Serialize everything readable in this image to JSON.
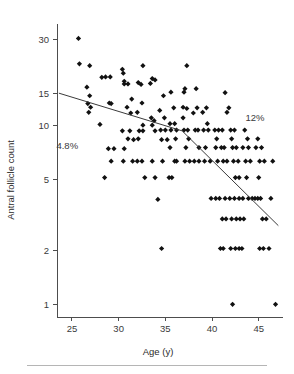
{
  "chart_data": {
    "type": "scatter",
    "title": "",
    "xlabel": "Age (y)",
    "ylabel": "Antral follicle count",
    "xlim": [
      23.4,
      47.6
    ],
    "ylim": [
      0.85,
      34
    ],
    "yscale": "log",
    "grid": false,
    "legend_position": "none",
    "xticks": [
      25,
      30,
      35,
      40,
      45
    ],
    "yticks": [
      1,
      2,
      5,
      10,
      15,
      30
    ],
    "xtick_labels": [
      "25",
      "30",
      "35",
      "40",
      "45"
    ],
    "ytick_labels": [
      "1",
      "2",
      "5",
      "10",
      "15",
      "30"
    ],
    "annotations": [
      {
        "name": "rate-left",
        "text": "4.8%",
        "x": 24.5,
        "y": 7.4
      },
      {
        "name": "rate-right",
        "text": "12%",
        "x": 44.6,
        "y": 10.6
      }
    ],
    "trend_line": {
      "name": "segmented-regression",
      "breakpoint_age": 36.8,
      "points": [
        {
          "x": 23.6,
          "y": 15.1
        },
        {
          "x": 36.8,
          "y": 9.3
        },
        {
          "x": 47.1,
          "y": 2.75
        }
      ]
    },
    "points": [
      {
        "x": 25.7,
        "y": 30.5
      },
      {
        "x": 25.8,
        "y": 22.0
      },
      {
        "x": 26.9,
        "y": 21.5
      },
      {
        "x": 26.6,
        "y": 16.3
      },
      {
        "x": 26.9,
        "y": 14.6
      },
      {
        "x": 26.7,
        "y": 13.2
      },
      {
        "x": 27.0,
        "y": 12.6
      },
      {
        "x": 26.8,
        "y": 11.8
      },
      {
        "x": 28.2,
        "y": 18.5
      },
      {
        "x": 28.6,
        "y": 18.6
      },
      {
        "x": 29.1,
        "y": 18.6
      },
      {
        "x": 29.0,
        "y": 13.3
      },
      {
        "x": 29.2,
        "y": 13.2
      },
      {
        "x": 28.0,
        "y": 10.1
      },
      {
        "x": 28.9,
        "y": 7.4
      },
      {
        "x": 29.5,
        "y": 7.4
      },
      {
        "x": 29.2,
        "y": 6.3
      },
      {
        "x": 28.5,
        "y": 5.1
      },
      {
        "x": 30.4,
        "y": 20.5
      },
      {
        "x": 30.5,
        "y": 19.5
      },
      {
        "x": 30.6,
        "y": 17.6
      },
      {
        "x": 30.6,
        "y": 17.0
      },
      {
        "x": 31.0,
        "y": 17.0
      },
      {
        "x": 31.4,
        "y": 14.0
      },
      {
        "x": 30.9,
        "y": 12.6
      },
      {
        "x": 31.3,
        "y": 11.7
      },
      {
        "x": 30.4,
        "y": 9.3
      },
      {
        "x": 31.2,
        "y": 9.3
      },
      {
        "x": 31.0,
        "y": 8.4
      },
      {
        "x": 30.6,
        "y": 7.4
      },
      {
        "x": 31.6,
        "y": 8.3
      },
      {
        "x": 31.5,
        "y": 6.3
      },
      {
        "x": 30.5,
        "y": 6.3
      },
      {
        "x": 32.6,
        "y": 21.5
      },
      {
        "x": 32.1,
        "y": 17.3
      },
      {
        "x": 32.4,
        "y": 16.9
      },
      {
        "x": 32.5,
        "y": 13.3
      },
      {
        "x": 32.0,
        "y": 11.8
      },
      {
        "x": 32.6,
        "y": 10.0
      },
      {
        "x": 32.2,
        "y": 9.3
      },
      {
        "x": 32.6,
        "y": 9.3
      },
      {
        "x": 32.1,
        "y": 8.4
      },
      {
        "x": 32.5,
        "y": 6.3
      },
      {
        "x": 32.0,
        "y": 6.3
      },
      {
        "x": 32.8,
        "y": 5.1
      },
      {
        "x": 33.4,
        "y": 17.1
      },
      {
        "x": 33.6,
        "y": 18.2
      },
      {
        "x": 33.9,
        "y": 17.9
      },
      {
        "x": 33.5,
        "y": 11.0
      },
      {
        "x": 33.8,
        "y": 10.6
      },
      {
        "x": 33.6,
        "y": 10.0
      },
      {
        "x": 33.9,
        "y": 9.3
      },
      {
        "x": 33.6,
        "y": 6.3
      },
      {
        "x": 33.9,
        "y": 5.1
      },
      {
        "x": 34.2,
        "y": 3.85
      },
      {
        "x": 34.6,
        "y": 2.05
      },
      {
        "x": 34.8,
        "y": 14.6
      },
      {
        "x": 34.4,
        "y": 12.1
      },
      {
        "x": 34.9,
        "y": 11.0
      },
      {
        "x": 34.5,
        "y": 9.4
      },
      {
        "x": 35.0,
        "y": 9.4
      },
      {
        "x": 34.6,
        "y": 8.3
      },
      {
        "x": 35.2,
        "y": 8.3
      },
      {
        "x": 34.7,
        "y": 6.3
      },
      {
        "x": 35.4,
        "y": 5.1
      },
      {
        "x": 35.7,
        "y": 5.1
      },
      {
        "x": 35.6,
        "y": 15.3
      },
      {
        "x": 35.9,
        "y": 12.5
      },
      {
        "x": 35.5,
        "y": 10.2
      },
      {
        "x": 36.0,
        "y": 10.2
      },
      {
        "x": 36.2,
        "y": 9.4
      },
      {
        "x": 35.6,
        "y": 9.4
      },
      {
        "x": 36.1,
        "y": 8.4
      },
      {
        "x": 35.5,
        "y": 7.5
      },
      {
        "x": 36.2,
        "y": 6.3
      },
      {
        "x": 36.0,
        "y": 6.3
      },
      {
        "x": 37.3,
        "y": 21.5
      },
      {
        "x": 37.0,
        "y": 15.3
      },
      {
        "x": 37.1,
        "y": 16.0
      },
      {
        "x": 36.9,
        "y": 12.6
      },
      {
        "x": 37.3,
        "y": 12.4
      },
      {
        "x": 36.9,
        "y": 11.0
      },
      {
        "x": 37.4,
        "y": 9.4
      },
      {
        "x": 37.0,
        "y": 9.4
      },
      {
        "x": 37.5,
        "y": 8.4
      },
      {
        "x": 37.2,
        "y": 7.5
      },
      {
        "x": 37.6,
        "y": 6.3
      },
      {
        "x": 37.1,
        "y": 6.3
      },
      {
        "x": 38.3,
        "y": 16.0
      },
      {
        "x": 38.4,
        "y": 12.5
      },
      {
        "x": 38.0,
        "y": 11.7
      },
      {
        "x": 38.5,
        "y": 9.4
      },
      {
        "x": 38.2,
        "y": 9.4
      },
      {
        "x": 38.6,
        "y": 7.5
      },
      {
        "x": 38.1,
        "y": 6.3
      },
      {
        "x": 38.6,
        "y": 6.3
      },
      {
        "x": 39.4,
        "y": 12.5
      },
      {
        "x": 39.0,
        "y": 11.8
      },
      {
        "x": 39.5,
        "y": 10.2
      },
      {
        "x": 39.1,
        "y": 9.4
      },
      {
        "x": 39.6,
        "y": 9.4
      },
      {
        "x": 39.3,
        "y": 7.5
      },
      {
        "x": 39.8,
        "y": 6.3
      },
      {
        "x": 39.2,
        "y": 6.3
      },
      {
        "x": 39.9,
        "y": 3.9
      },
      {
        "x": 40.3,
        "y": 9.4
      },
      {
        "x": 40.7,
        "y": 9.4
      },
      {
        "x": 41.1,
        "y": 9.4
      },
      {
        "x": 40.5,
        "y": 8.4
      },
      {
        "x": 41.0,
        "y": 7.5
      },
      {
        "x": 40.4,
        "y": 7.5
      },
      {
        "x": 41.3,
        "y": 7.5
      },
      {
        "x": 40.6,
        "y": 6.3
      },
      {
        "x": 41.2,
        "y": 6.3
      },
      {
        "x": 41.6,
        "y": 6.3
      },
      {
        "x": 40.4,
        "y": 3.9
      },
      {
        "x": 40.8,
        "y": 3.9
      },
      {
        "x": 41.4,
        "y": 3.9
      },
      {
        "x": 41.9,
        "y": 3.9
      },
      {
        "x": 40.9,
        "y": 2.05
      },
      {
        "x": 41.2,
        "y": 2.05
      },
      {
        "x": 41.1,
        "y": 3.0
      },
      {
        "x": 41.5,
        "y": 3.0
      },
      {
        "x": 41.8,
        "y": 12.5
      },
      {
        "x": 41.4,
        "y": 15.2
      },
      {
        "x": 41.6,
        "y": 11.8
      },
      {
        "x": 42.0,
        "y": 9.4
      },
      {
        "x": 42.4,
        "y": 9.4
      },
      {
        "x": 42.1,
        "y": 8.4
      },
      {
        "x": 42.6,
        "y": 7.5
      },
      {
        "x": 42.2,
        "y": 7.5
      },
      {
        "x": 42.8,
        "y": 6.3
      },
      {
        "x": 42.3,
        "y": 6.3
      },
      {
        "x": 42.5,
        "y": 5.1
      },
      {
        "x": 42.9,
        "y": 5.1
      },
      {
        "x": 42.4,
        "y": 3.9
      },
      {
        "x": 42.9,
        "y": 3.9
      },
      {
        "x": 43.3,
        "y": 3.9
      },
      {
        "x": 42.1,
        "y": 3.0
      },
      {
        "x": 42.6,
        "y": 3.0
      },
      {
        "x": 43.0,
        "y": 3.0
      },
      {
        "x": 43.4,
        "y": 3.0
      },
      {
        "x": 42.0,
        "y": 2.05
      },
      {
        "x": 42.5,
        "y": 2.05
      },
      {
        "x": 42.9,
        "y": 2.05
      },
      {
        "x": 43.2,
        "y": 2.05
      },
      {
        "x": 42.2,
        "y": 1.0
      },
      {
        "x": 43.5,
        "y": 9.4
      },
      {
        "x": 43.8,
        "y": 8.4
      },
      {
        "x": 43.3,
        "y": 7.5
      },
      {
        "x": 43.9,
        "y": 7.5
      },
      {
        "x": 43.6,
        "y": 6.3
      },
      {
        "x": 44.1,
        "y": 6.3
      },
      {
        "x": 43.7,
        "y": 5.1
      },
      {
        "x": 43.9,
        "y": 3.9
      },
      {
        "x": 44.3,
        "y": 3.9
      },
      {
        "x": 44.6,
        "y": 3.9
      },
      {
        "x": 44.9,
        "y": 3.9
      },
      {
        "x": 45.2,
        "y": 3.9
      },
      {
        "x": 44.9,
        "y": 8.4
      },
      {
        "x": 45.3,
        "y": 7.5
      },
      {
        "x": 44.7,
        "y": 7.5
      },
      {
        "x": 45.1,
        "y": 6.3
      },
      {
        "x": 45.6,
        "y": 6.3
      },
      {
        "x": 45.0,
        "y": 5.1
      },
      {
        "x": 45.4,
        "y": 3.0
      },
      {
        "x": 45.8,
        "y": 3.0
      },
      {
        "x": 45.1,
        "y": 2.05
      },
      {
        "x": 45.5,
        "y": 2.05
      },
      {
        "x": 46.1,
        "y": 2.05
      },
      {
        "x": 46.3,
        "y": 3.9
      },
      {
        "x": 46.5,
        "y": 6.3
      },
      {
        "x": 46.8,
        "y": 1.0
      }
    ]
  }
}
